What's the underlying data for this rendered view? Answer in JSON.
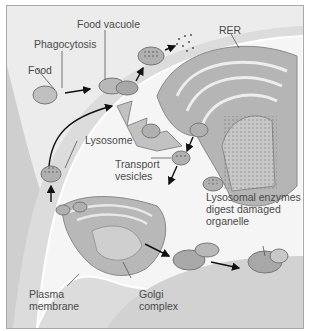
{
  "diagram": {
    "type": "cell-biology-lysosome-function",
    "labels": {
      "food": "Food",
      "phagocytosis": "Phagocytosis",
      "food_vacuole": "Food vacuole",
      "rer": "RER",
      "lysosome": "Lysosome",
      "transport_vesicles": "Transport\nvesicles",
      "lysosomal_enzymes": "Lysosomal enzymes\ndigest damaged\norganelle",
      "plasma_membrane": "Plasma\nmembrane",
      "golgi_complex": "Golgi\ncomplex"
    },
    "colors": {
      "background": "#ececec",
      "cytoplasm": "#f4f4f4",
      "organelle": "#b9b9b9",
      "organelle_dark": "#8c8c8c",
      "membrane": "#d6d6d6",
      "arrow": "#111111",
      "text": "#4a4a4a"
    },
    "flows": [
      "Food -> Phagocytosis -> Food vacuole",
      "Food vacuole + Lysosome -> digestion -> residue",
      "RER -> Transport vesicles -> Golgi complex",
      "Golgi complex -> Lysosome",
      "Lysosome + damaged organelle -> digestion"
    ]
  }
}
